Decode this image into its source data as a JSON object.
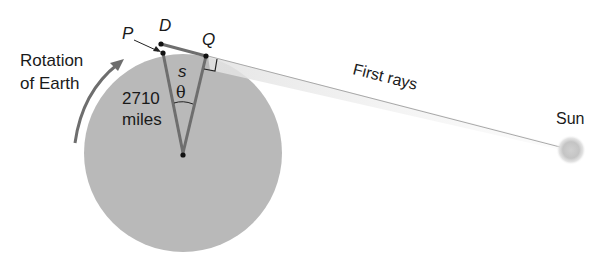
{
  "diagram": {
    "labels": {
      "rotation_line1": "Rotation",
      "rotation_line2": "of Earth",
      "distance_value": "2710",
      "distance_unit": "miles",
      "point_p": "P",
      "point_d": "D",
      "point_q": "Q",
      "arc_s": "s",
      "angle_theta": "θ",
      "first_rays": "First rays",
      "sun": "Sun"
    },
    "colors": {
      "earth": "#b9b9b9",
      "lines": "#6e6e6e",
      "points": "#111111",
      "text": "#1a1a1a",
      "sun": "#c8c8c8"
    }
  }
}
